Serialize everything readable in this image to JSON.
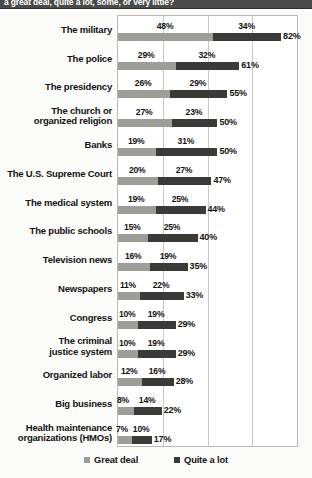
{
  "header": {
    "text": "a great deal, quite a lot, some, or very little?"
  },
  "legend": {
    "items": [
      {
        "label": "Great deal",
        "color": "#9d9d9a",
        "key": "great"
      },
      {
        "label": "Quite a lot",
        "color": "#3a3a39",
        "key": "quite"
      }
    ]
  },
  "chart_data": {
    "type": "bar",
    "orientation": "horizontal",
    "stacked": true,
    "title": "a great deal, quite a lot, some, or very little?",
    "xlabel": "",
    "ylabel": "",
    "xlim": [
      0,
      90
    ],
    "grid": true,
    "gridlines": [
      0,
      22.5,
      45,
      67.5,
      90
    ],
    "legend_position": "bottom",
    "categories": [
      "The military",
      "The police",
      "The presidency",
      "The church or organized religion",
      "Banks",
      "The U.S. Supreme Court",
      "The medical system",
      "The public schools",
      "Television news",
      "Newspapers",
      "Congress",
      "The criminal justice system",
      "Organized labor",
      "Big business",
      "Health maintenance organizations (HMOs)"
    ],
    "series": [
      {
        "name": "Great deal",
        "color": "#9d9d9a",
        "values": [
          48,
          29,
          26,
          27,
          19,
          20,
          19,
          15,
          16,
          11,
          10,
          10,
          12,
          8,
          7
        ]
      },
      {
        "name": "Quite a lot",
        "color": "#3a3a39",
        "values": [
          34,
          32,
          29,
          23,
          31,
          27,
          25,
          25,
          19,
          22,
          19,
          19,
          16,
          14,
          10
        ]
      }
    ],
    "totals": [
      82,
      61,
      55,
      50,
      50,
      47,
      44,
      40,
      35,
      33,
      29,
      29,
      28,
      22,
      17
    ],
    "value_label_suffix": "%"
  },
  "rows": [
    {
      "label": "The military",
      "label_lines": [
        "The military"
      ],
      "great": 48,
      "quite": 34,
      "total": 82
    },
    {
      "label": "The police",
      "label_lines": [
        "The police"
      ],
      "great": 29,
      "quite": 32,
      "total": 61
    },
    {
      "label": "The presidency",
      "label_lines": [
        "The presidency"
      ],
      "great": 26,
      "quite": 29,
      "total": 55
    },
    {
      "label": "The church or organized religion",
      "label_lines": [
        "The church or",
        "organized religion"
      ],
      "great": 27,
      "quite": 23,
      "total": 50
    },
    {
      "label": "Banks",
      "label_lines": [
        "Banks"
      ],
      "great": 19,
      "quite": 31,
      "total": 50
    },
    {
      "label": "The U.S. Supreme Court",
      "label_lines": [
        "The U.S. Supreme Court"
      ],
      "great": 20,
      "quite": 27,
      "total": 47
    },
    {
      "label": "The medical system",
      "label_lines": [
        "The medical system"
      ],
      "great": 19,
      "quite": 25,
      "total": 44
    },
    {
      "label": "The public schools",
      "label_lines": [
        "The public schools"
      ],
      "great": 15,
      "quite": 25,
      "total": 40
    },
    {
      "label": "Television news",
      "label_lines": [
        "Television news"
      ],
      "great": 16,
      "quite": 19,
      "total": 35
    },
    {
      "label": "Newspapers",
      "label_lines": [
        "Newspapers"
      ],
      "great": 11,
      "quite": 22,
      "total": 33
    },
    {
      "label": "Congress",
      "label_lines": [
        "Congress"
      ],
      "great": 10,
      "quite": 19,
      "total": 29
    },
    {
      "label": "The criminal justice system",
      "label_lines": [
        "The criminal",
        "justice system"
      ],
      "great": 10,
      "quite": 19,
      "total": 29
    },
    {
      "label": "Organized labor",
      "label_lines": [
        "Organized labor"
      ],
      "great": 12,
      "quite": 16,
      "total": 28
    },
    {
      "label": "Big business",
      "label_lines": [
        "Big business"
      ],
      "great": 8,
      "quite": 14,
      "total": 22
    },
    {
      "label": "Health maintenance organizations (HMOs)",
      "label_lines": [
        "Health maintenance",
        "organizations (HMOs)"
      ],
      "great": 7,
      "quite": 10,
      "total": 17
    }
  ]
}
